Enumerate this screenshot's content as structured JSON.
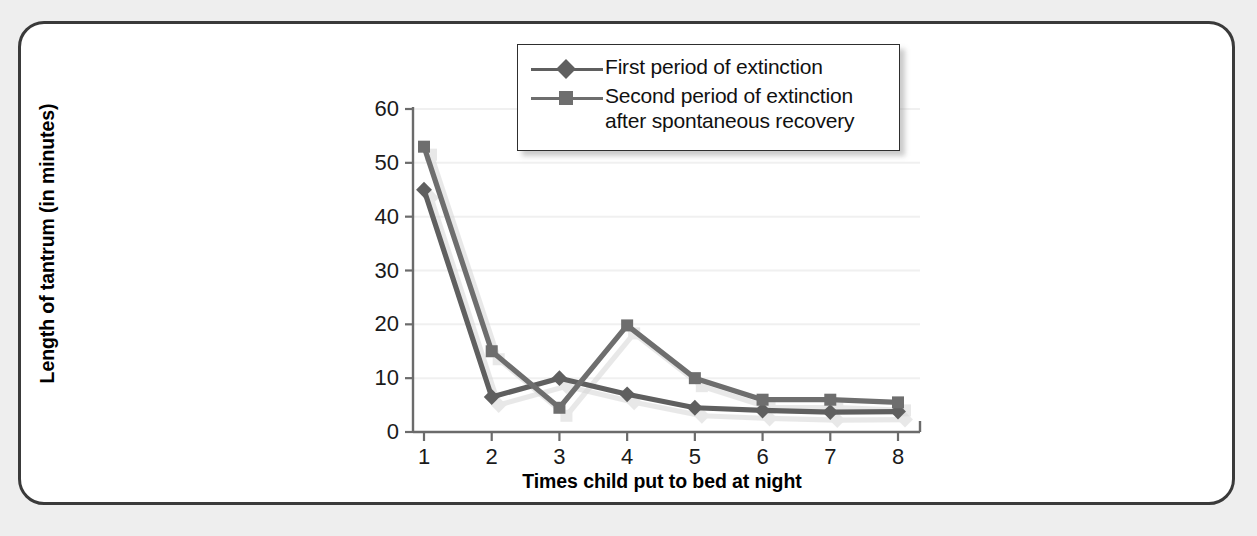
{
  "figure": {
    "frame_border_color": "#3a3a3a",
    "page_background": "#eeeeee",
    "plot_background": "#ffffff"
  },
  "legend": {
    "position": "top-center-right",
    "entries": [
      {
        "label": "First period of extinction",
        "marker": "diamond",
        "color": "#5f5f5f"
      },
      {
        "label": "Second period of extinction\nafter spontaneous recovery",
        "marker": "square",
        "color": "#6e6e6e"
      }
    ]
  },
  "axes": {
    "y_title": "Length of tantrum (in minutes)",
    "x_title": "Times child put to bed at night",
    "y_ticks": [
      "0",
      "10",
      "20",
      "30",
      "40",
      "50",
      "60"
    ],
    "x_ticks": [
      "1",
      "2",
      "3",
      "4",
      "5",
      "6",
      "7",
      "8"
    ]
  },
  "chart_data": {
    "type": "line",
    "title": "",
    "subtitle": "",
    "xlabel": "Times child put to bed at night",
    "ylabel": "Length of tantrum (in minutes)",
    "categories": [
      1,
      2,
      3,
      4,
      5,
      6,
      7,
      8
    ],
    "x": [
      1,
      2,
      3,
      4,
      5,
      6,
      7,
      8
    ],
    "xlim": [
      0.5,
      8.5
    ],
    "ylim": [
      0,
      60
    ],
    "y_ticks": [
      0,
      10,
      20,
      30,
      40,
      50,
      60
    ],
    "x_ticks": [
      1,
      2,
      3,
      4,
      5,
      6,
      7,
      8
    ],
    "grid": "horizontal-only-faint",
    "legend_position": "upper center-right inside",
    "series": [
      {
        "name": "First period of extinction",
        "marker": "diamond",
        "color": "#5f5f5f",
        "values": [
          45,
          6.5,
          10,
          7,
          4.5,
          4,
          3.7,
          3.8
        ]
      },
      {
        "name": "Second period of extinction after spontaneous recovery",
        "marker": "square",
        "color": "#6e6e6e",
        "values": [
          53,
          15,
          4.5,
          19.8,
          10,
          6,
          6,
          5.5
        ]
      }
    ],
    "annotations": []
  }
}
